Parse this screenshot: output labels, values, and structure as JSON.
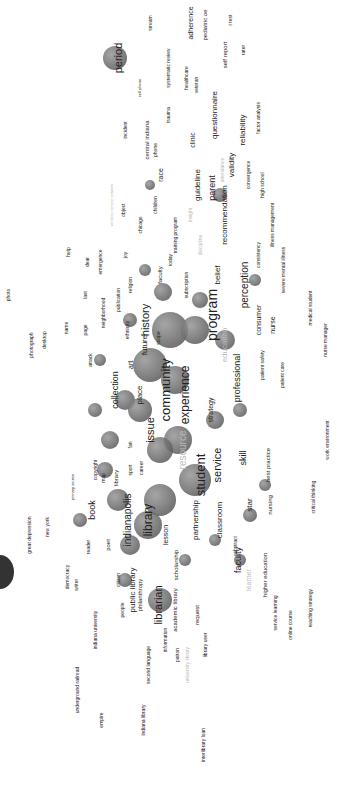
{
  "map": {
    "type": "term co-occurrence network (rotated 90°)",
    "colors": {
      "bubble_dark": "#555555",
      "bubble_light": "#bbbbbb",
      "label": "#222222",
      "label_faint": "#bbbbbb"
    },
    "bubbles": [
      {
        "x": 115,
        "y": 58,
        "r": 12
      },
      {
        "x": 150,
        "y": 185,
        "r": 5
      },
      {
        "x": 163,
        "y": 292,
        "r": 9
      },
      {
        "x": 170,
        "y": 330,
        "r": 18
      },
      {
        "x": 195,
        "y": 330,
        "r": 14
      },
      {
        "x": 150,
        "y": 365,
        "r": 17
      },
      {
        "x": 175,
        "y": 380,
        "r": 14
      },
      {
        "x": 125,
        "y": 400,
        "r": 10
      },
      {
        "x": 140,
        "y": 410,
        "r": 12
      },
      {
        "x": 178,
        "y": 440,
        "r": 14
      },
      {
        "x": 160,
        "y": 450,
        "r": 13
      },
      {
        "x": 195,
        "y": 480,
        "r": 16
      },
      {
        "x": 160,
        "y": 500,
        "r": 16
      },
      {
        "x": 118,
        "y": 500,
        "r": 11
      },
      {
        "x": 148,
        "y": 525,
        "r": 14
      },
      {
        "x": 130,
        "y": 545,
        "r": 10
      },
      {
        "x": 105,
        "y": 470,
        "r": 8
      },
      {
        "x": 215,
        "y": 420,
        "r": 9
      },
      {
        "x": 240,
        "y": 410,
        "r": 7
      },
      {
        "x": 265,
        "y": 485,
        "r": 6
      },
      {
        "x": 160,
        "y": 600,
        "r": 12
      },
      {
        "x": 95,
        "y": 410,
        "r": 7
      },
      {
        "x": 100,
        "y": 360,
        "r": 6
      },
      {
        "x": 130,
        "y": 320,
        "r": 7
      },
      {
        "x": 145,
        "y": 270,
        "r": 6
      },
      {
        "x": 220,
        "y": 195,
        "r": 7
      },
      {
        "x": 255,
        "y": 280,
        "r": 6
      },
      {
        "x": 80,
        "y": 520,
        "r": 7
      },
      {
        "x": 250,
        "y": 515,
        "r": 7
      },
      {
        "x": 240,
        "y": 560,
        "r": 6
      },
      {
        "x": 215,
        "y": 540,
        "r": 6
      },
      {
        "x": 200,
        "y": 300,
        "r": 8
      },
      {
        "x": 225,
        "y": 340,
        "r": 10
      },
      {
        "x": 110,
        "y": 440,
        "r": 9
      },
      {
        "x": 125,
        "y": 580,
        "r": 7
      },
      {
        "x": 185,
        "y": 560,
        "r": 6
      }
    ],
    "terms": [
      {
        "label": "period",
        "x": 118,
        "y": 58,
        "size": 11,
        "faint": false
      },
      {
        "label": "stream",
        "x": 150,
        "y": 23,
        "size": 5,
        "faint": false
      },
      {
        "label": "systematic review",
        "x": 168,
        "y": 68,
        "size": 5,
        "faint": false
      },
      {
        "label": "adherence",
        "x": 190,
        "y": 23,
        "size": 7,
        "faint": false
      },
      {
        "label": "pediatric oe",
        "x": 205,
        "y": 25,
        "size": 6,
        "faint": false
      },
      {
        "label": "t test",
        "x": 230,
        "y": 20,
        "size": 5,
        "faint": false
      },
      {
        "label": "healthcare",
        "x": 186,
        "y": 78,
        "size": 5,
        "faint": false
      },
      {
        "label": "veteran",
        "x": 196,
        "y": 85,
        "size": 5,
        "faint": false
      },
      {
        "label": "self report",
        "x": 225,
        "y": 55,
        "size": 6,
        "faint": false
      },
      {
        "label": "rater",
        "x": 243,
        "y": 50,
        "size": 5,
        "faint": false
      },
      {
        "label": "cell phone",
        "x": 140,
        "y": 88,
        "size": 4,
        "faint": false
      },
      {
        "label": "central indiana",
        "x": 147,
        "y": 140,
        "size": 6,
        "faint": false
      },
      {
        "label": "trauma",
        "x": 168,
        "y": 115,
        "size": 5,
        "faint": false
      },
      {
        "label": "incident",
        "x": 125,
        "y": 130,
        "size": 5,
        "faint": false
      },
      {
        "label": "phone",
        "x": 155,
        "y": 150,
        "size": 5,
        "faint": false
      },
      {
        "label": "questionnaire",
        "x": 215,
        "y": 115,
        "size": 8,
        "faint": false
      },
      {
        "label": "reliability",
        "x": 243,
        "y": 130,
        "size": 8,
        "faint": false
      },
      {
        "label": "factor analysis",
        "x": 258,
        "y": 118,
        "size": 5,
        "faint": false
      },
      {
        "label": "clinic",
        "x": 192,
        "y": 140,
        "size": 7,
        "faint": false
      },
      {
        "label": "attendance",
        "x": 222,
        "y": 170,
        "size": 5,
        "faint": true
      },
      {
        "label": "validity",
        "x": 232,
        "y": 165,
        "size": 8,
        "faint": false
      },
      {
        "label": "convergence",
        "x": 248,
        "y": 175,
        "size": 5,
        "faint": false
      },
      {
        "label": "high school",
        "x": 262,
        "y": 185,
        "size": 5,
        "faint": false
      },
      {
        "label": "race",
        "x": 160,
        "y": 175,
        "size": 7,
        "faint": false
      },
      {
        "label": "children",
        "x": 155,
        "y": 205,
        "size": 5,
        "faint": false
      },
      {
        "label": "guideline",
        "x": 198,
        "y": 185,
        "size": 8,
        "faint": false
      },
      {
        "label": "parent",
        "x": 212,
        "y": 188,
        "size": 9,
        "faint": false
      },
      {
        "label": "recommendation",
        "x": 225,
        "y": 215,
        "size": 8,
        "faint": false
      },
      {
        "label": "illness management",
        "x": 272,
        "y": 225,
        "size": 5,
        "faint": false
      },
      {
        "label": "severe mental illness",
        "x": 283,
        "y": 270,
        "size": 5,
        "faint": false
      },
      {
        "label": "consistency",
        "x": 258,
        "y": 255,
        "size": 5,
        "faint": false
      },
      {
        "label": "wireless sensor network",
        "x": 112,
        "y": 205,
        "size": 4,
        "faint": true
      },
      {
        "label": "object",
        "x": 123,
        "y": 210,
        "size": 5,
        "faint": false
      },
      {
        "label": "chicago",
        "x": 140,
        "y": 225,
        "size": 5,
        "faint": false
      },
      {
        "label": "joy",
        "x": 125,
        "y": 255,
        "size": 5,
        "faint": false
      },
      {
        "label": "today",
        "x": 170,
        "y": 260,
        "size": 5,
        "faint": false
      },
      {
        "label": "training program",
        "x": 175,
        "y": 235,
        "size": 5,
        "faint": false
      },
      {
        "label": "insight",
        "x": 190,
        "y": 215,
        "size": 5,
        "faint": true
      },
      {
        "label": "discipline",
        "x": 200,
        "y": 245,
        "size": 5,
        "faint": true
      },
      {
        "label": "belief",
        "x": 218,
        "y": 275,
        "size": 8,
        "faint": false
      },
      {
        "label": "perception",
        "x": 245,
        "y": 285,
        "size": 10,
        "faint": false
      },
      {
        "label": "consumer",
        "x": 258,
        "y": 320,
        "size": 7,
        "faint": false
      },
      {
        "label": "nurse",
        "x": 272,
        "y": 325,
        "size": 7,
        "faint": false
      },
      {
        "label": "medical student",
        "x": 310,
        "y": 308,
        "size": 5,
        "faint": false
      },
      {
        "label": "nurse manager",
        "x": 325,
        "y": 340,
        "size": 5,
        "faint": false
      },
      {
        "label": "patient safety",
        "x": 262,
        "y": 365,
        "size": 5,
        "faint": false
      },
      {
        "label": "patient care",
        "x": 282,
        "y": 375,
        "size": 5,
        "faint": false
      },
      {
        "label": "program",
        "x": 212,
        "y": 315,
        "size": 14,
        "faint": false
      },
      {
        "label": "education",
        "x": 225,
        "y": 345,
        "size": 8,
        "faint": true
      },
      {
        "label": "professional",
        "x": 237,
        "y": 378,
        "size": 9,
        "faint": false
      },
      {
        "label": "subscription",
        "x": 186,
        "y": 285,
        "size": 5,
        "faint": false
      },
      {
        "label": "faculty",
        "x": 160,
        "y": 275,
        "size": 6,
        "faint": false
      },
      {
        "label": "history",
        "x": 145,
        "y": 320,
        "size": 11,
        "faint": false
      },
      {
        "label": "future",
        "x": 145,
        "y": 345,
        "size": 8,
        "faint": false
      },
      {
        "label": "scope",
        "x": 158,
        "y": 338,
        "size": 5,
        "faint": false
      },
      {
        "label": "ethnicity",
        "x": 127,
        "y": 330,
        "size": 5,
        "faint": false
      },
      {
        "label": "neighborhood",
        "x": 103,
        "y": 313,
        "size": 5,
        "faint": false
      },
      {
        "label": "publication",
        "x": 118,
        "y": 300,
        "size": 5,
        "faint": false
      },
      {
        "label": "religion",
        "x": 130,
        "y": 285,
        "size": 5,
        "faint": false
      },
      {
        "label": "emergence",
        "x": 100,
        "y": 262,
        "size": 5,
        "faint": false
      },
      {
        "label": "dear",
        "x": 87,
        "y": 262,
        "size": 5,
        "faint": false
      },
      {
        "label": "help",
        "x": 68,
        "y": 252,
        "size": 5,
        "faint": false
      },
      {
        "label": "last",
        "x": 85,
        "y": 295,
        "size": 5,
        "faint": false
      },
      {
        "label": "name",
        "x": 66,
        "y": 328,
        "size": 5,
        "faint": false
      },
      {
        "label": "page",
        "x": 85,
        "y": 330,
        "size": 5,
        "faint": false
      },
      {
        "label": "photograph",
        "x": 31,
        "y": 345,
        "size": 5,
        "faint": false
      },
      {
        "label": "desktop",
        "x": 44,
        "y": 340,
        "size": 5,
        "faint": false
      },
      {
        "label": "photo",
        "x": 8,
        "y": 295,
        "size": 5,
        "faint": false
      },
      {
        "label": "attack",
        "x": 90,
        "y": 360,
        "size": 5,
        "faint": false
      },
      {
        "label": "art",
        "x": 130,
        "y": 365,
        "size": 7,
        "faint": false
      },
      {
        "label": "community",
        "x": 165,
        "y": 390,
        "size": 13,
        "faint": false
      },
      {
        "label": "experience",
        "x": 185,
        "y": 395,
        "size": 12,
        "faint": false
      },
      {
        "label": "collection",
        "x": 115,
        "y": 390,
        "size": 9,
        "faint": false
      },
      {
        "label": "place",
        "x": 140,
        "y": 395,
        "size": 8,
        "faint": false
      },
      {
        "label": "issue",
        "x": 150,
        "y": 430,
        "size": 11,
        "faint": false
      },
      {
        "label": "strategy",
        "x": 210,
        "y": 410,
        "size": 7,
        "faint": false
      },
      {
        "label": "resource",
        "x": 183,
        "y": 450,
        "size": 10,
        "faint": true
      },
      {
        "label": "student",
        "x": 200,
        "y": 475,
        "size": 13,
        "faint": false
      },
      {
        "label": "service",
        "x": 217,
        "y": 465,
        "size": 11,
        "faint": false
      },
      {
        "label": "skill",
        "x": 243,
        "y": 458,
        "size": 9,
        "faint": false
      },
      {
        "label": "best practice",
        "x": 268,
        "y": 465,
        "size": 6,
        "faint": false
      },
      {
        "label": "work environment",
        "x": 327,
        "y": 440,
        "size": 5,
        "faint": false
      },
      {
        "label": "critical thinking",
        "x": 313,
        "y": 497,
        "size": 5,
        "faint": false
      },
      {
        "label": "nursing",
        "x": 270,
        "y": 505,
        "size": 6,
        "faint": false
      },
      {
        "label": "star",
        "x": 250,
        "y": 505,
        "size": 8,
        "faint": false
      },
      {
        "label": "partnership",
        "x": 196,
        "y": 520,
        "size": 8,
        "faint": false
      },
      {
        "label": "classroom",
        "x": 220,
        "y": 520,
        "size": 8,
        "faint": false
      },
      {
        "label": "abstract",
        "x": 235,
        "y": 545,
        "size": 5,
        "faint": false
      },
      {
        "label": "faculty",
        "x": 238,
        "y": 560,
        "size": 9,
        "faint": false
      },
      {
        "label": "learner",
        "x": 248,
        "y": 580,
        "size": 7,
        "faint": true
      },
      {
        "label": "higher education",
        "x": 265,
        "y": 575,
        "size": 6,
        "faint": false
      },
      {
        "label": "service learning",
        "x": 275,
        "y": 613,
        "size": 5,
        "faint": false
      },
      {
        "label": "online course",
        "x": 290,
        "y": 625,
        "size": 5,
        "faint": false
      },
      {
        "label": "teaching strategy",
        "x": 310,
        "y": 608,
        "size": 5,
        "faint": false
      },
      {
        "label": "library",
        "x": 148,
        "y": 520,
        "size": 12,
        "faint": false
      },
      {
        "label": "indianapolis",
        "x": 128,
        "y": 520,
        "size": 10,
        "faint": false
      },
      {
        "label": "book",
        "x": 92,
        "y": 510,
        "size": 9,
        "faint": false
      },
      {
        "label": "poet",
        "x": 108,
        "y": 545,
        "size": 6,
        "faint": false
      },
      {
        "label": "reader",
        "x": 88,
        "y": 547,
        "size": 5,
        "faint": false
      },
      {
        "label": "lesson",
        "x": 165,
        "y": 535,
        "size": 7,
        "faint": false
      },
      {
        "label": "scholarship",
        "x": 176,
        "y": 565,
        "size": 6,
        "faint": false
      },
      {
        "label": "philanthropy",
        "x": 140,
        "y": 595,
        "size": 6,
        "faint": false
      },
      {
        "label": "public library",
        "x": 133,
        "y": 590,
        "size": 8,
        "faint": false
      },
      {
        "label": "citizen",
        "x": 118,
        "y": 580,
        "size": 5,
        "faint": false
      },
      {
        "label": "librarian",
        "x": 158,
        "y": 605,
        "size": 11,
        "faint": false
      },
      {
        "label": "academic library",
        "x": 175,
        "y": 610,
        "size": 6,
        "faint": false
      },
      {
        "label": "request",
        "x": 197,
        "y": 615,
        "size": 6,
        "faint": false
      },
      {
        "label": "library user",
        "x": 205,
        "y": 645,
        "size": 5,
        "faint": false
      },
      {
        "label": "patron",
        "x": 177,
        "y": 655,
        "size": 5,
        "faint": false
      },
      {
        "label": "university library",
        "x": 187,
        "y": 665,
        "size": 5,
        "faint": true
      },
      {
        "label": "information",
        "x": 165,
        "y": 640,
        "size": 5,
        "faint": false
      },
      {
        "label": "second language",
        "x": 148,
        "y": 665,
        "size": 5,
        "faint": false
      },
      {
        "label": "indiana library",
        "x": 143,
        "y": 720,
        "size": 5,
        "faint": false
      },
      {
        "label": "interlibrary loan",
        "x": 203,
        "y": 745,
        "size": 5,
        "faint": false
      },
      {
        "label": "people",
        "x": 122,
        "y": 610,
        "size": 5,
        "faint": false
      },
      {
        "label": "democracy",
        "x": 67,
        "y": 577,
        "size": 5,
        "faint": false
      },
      {
        "label": "writer",
        "x": 76,
        "y": 585,
        "size": 5,
        "faint": false
      },
      {
        "label": "indiana university",
        "x": 95,
        "y": 630,
        "size": 5,
        "faint": false
      },
      {
        "label": "underground railroad",
        "x": 77,
        "y": 690,
        "size": 5,
        "faint": false
      },
      {
        "label": "empire",
        "x": 101,
        "y": 720,
        "size": 5,
        "faint": false
      },
      {
        "label": "great depression",
        "x": 29,
        "y": 535,
        "size": 5,
        "faint": false
      },
      {
        "label": "new york",
        "x": 47,
        "y": 527,
        "size": 5,
        "faint": false
      },
      {
        "label": "primary source",
        "x": 73,
        "y": 487,
        "size": 4,
        "faint": false
      },
      {
        "label": "copyright",
        "x": 95,
        "y": 470,
        "size": 5,
        "faint": false
      },
      {
        "label": "map",
        "x": 103,
        "y": 478,
        "size": 5,
        "faint": false
      },
      {
        "label": "library",
        "x": 116,
        "y": 478,
        "size": 6,
        "faint": false
      },
      {
        "label": "career",
        "x": 141,
        "y": 468,
        "size": 5,
        "faint": false
      },
      {
        "label": "sport",
        "x": 130,
        "y": 470,
        "size": 5,
        "faint": false
      },
      {
        "label": "fan",
        "x": 130,
        "y": 445,
        "size": 5,
        "faint": false
      }
    ]
  }
}
